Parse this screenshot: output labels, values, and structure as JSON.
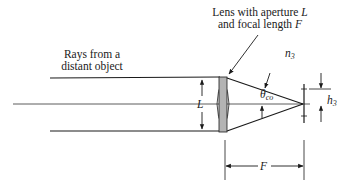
{
  "diagram": {
    "labels": {
      "rays_line1": "Rays from a",
      "rays_line2": "distant object",
      "lens_line1_prefix": "Lens with aperture ",
      "lens_line1_var": "L",
      "lens_line2_prefix": "and focal length ",
      "lens_line2_var": "F",
      "medium": "n",
      "medium_sub": "3",
      "angle": "θ",
      "angle_sub": "co",
      "aperture": "L",
      "height": "h",
      "height_sub": "3",
      "focal_length": "F"
    },
    "colors": {
      "line": "#1a1a1a",
      "lens_fill": "#b3b3b3",
      "axis": "#333333"
    }
  }
}
